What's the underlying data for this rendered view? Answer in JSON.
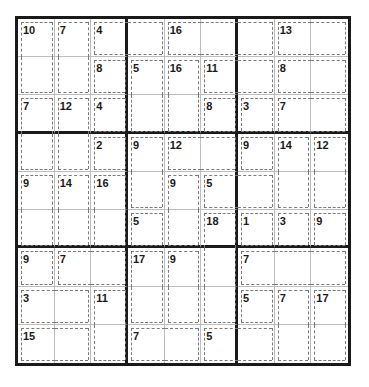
{
  "puzzle": {
    "type": "killer-sudoku",
    "size": 9,
    "cages": [
      {
        "sum": "10",
        "cells": [
          [
            0,
            0
          ],
          [
            1,
            0
          ]
        ]
      },
      {
        "sum": "7",
        "cells": [
          [
            0,
            1
          ],
          [
            1,
            1
          ]
        ]
      },
      {
        "sum": "4",
        "cells": [
          [
            0,
            2
          ],
          [
            0,
            3
          ]
        ]
      },
      {
        "sum": "16",
        "cells": [
          [
            0,
            4
          ],
          [
            0,
            5
          ],
          [
            0,
            6
          ]
        ]
      },
      {
        "sum": "13",
        "cells": [
          [
            0,
            7
          ],
          [
            0,
            8
          ]
        ]
      },
      {
        "sum": "8",
        "cells": [
          [
            1,
            2
          ]
        ]
      },
      {
        "sum": "5",
        "cells": [
          [
            1,
            3
          ],
          [
            2,
            3
          ]
        ]
      },
      {
        "sum": "16",
        "cells": [
          [
            1,
            4
          ],
          [
            2,
            4
          ]
        ]
      },
      {
        "sum": "11",
        "cells": [
          [
            1,
            5
          ],
          [
            1,
            6
          ]
        ]
      },
      {
        "sum": "8",
        "cells": [
          [
            1,
            7
          ],
          [
            1,
            8
          ]
        ]
      },
      {
        "sum": "7",
        "cells": [
          [
            2,
            0
          ],
          [
            3,
            0
          ]
        ]
      },
      {
        "sum": "12",
        "cells": [
          [
            2,
            1
          ],
          [
            3,
            1
          ]
        ]
      },
      {
        "sum": "4",
        "cells": [
          [
            2,
            2
          ]
        ]
      },
      {
        "sum": "8",
        "cells": [
          [
            2,
            5
          ]
        ]
      },
      {
        "sum": "3",
        "cells": [
          [
            2,
            6
          ]
        ]
      },
      {
        "sum": "7",
        "cells": [
          [
            2,
            7
          ],
          [
            2,
            8
          ]
        ]
      },
      {
        "sum": "2",
        "cells": [
          [
            3,
            2
          ]
        ]
      },
      {
        "sum": "9",
        "cells": [
          [
            3,
            3
          ],
          [
            4,
            3
          ]
        ]
      },
      {
        "sum": "12",
        "cells": [
          [
            3,
            4
          ],
          [
            3,
            5
          ]
        ]
      },
      {
        "sum": "9",
        "cells": [
          [
            3,
            6
          ]
        ]
      },
      {
        "sum": "14",
        "cells": [
          [
            3,
            7
          ],
          [
            4,
            7
          ]
        ]
      },
      {
        "sum": "12",
        "cells": [
          [
            3,
            8
          ],
          [
            4,
            8
          ]
        ]
      },
      {
        "sum": "9",
        "cells": [
          [
            4,
            0
          ],
          [
            5,
            0
          ]
        ]
      },
      {
        "sum": "14",
        "cells": [
          [
            4,
            1
          ],
          [
            5,
            1
          ]
        ]
      },
      {
        "sum": "16",
        "cells": [
          [
            4,
            2
          ],
          [
            5,
            2
          ]
        ]
      },
      {
        "sum": "9",
        "cells": [
          [
            4,
            4
          ],
          [
            5,
            4
          ]
        ]
      },
      {
        "sum": "5",
        "cells": [
          [
            4,
            5
          ],
          [
            4,
            6
          ]
        ]
      },
      {
        "sum": "5",
        "cells": [
          [
            5,
            3
          ]
        ]
      },
      {
        "sum": "18",
        "cells": [
          [
            5,
            5
          ],
          [
            6,
            5
          ],
          [
            7,
            5
          ]
        ]
      },
      {
        "sum": "1",
        "cells": [
          [
            5,
            6
          ]
        ]
      },
      {
        "sum": "3",
        "cells": [
          [
            5,
            7
          ]
        ]
      },
      {
        "sum": "9",
        "cells": [
          [
            5,
            8
          ]
        ]
      },
      {
        "sum": "9",
        "cells": [
          [
            6,
            0
          ]
        ]
      },
      {
        "sum": "7",
        "cells": [
          [
            6,
            1
          ],
          [
            6,
            2
          ]
        ]
      },
      {
        "sum": "17",
        "cells": [
          [
            6,
            3
          ],
          [
            7,
            3
          ]
        ]
      },
      {
        "sum": "9",
        "cells": [
          [
            6,
            4
          ],
          [
            7,
            4
          ]
        ]
      },
      {
        "sum": "7",
        "cells": [
          [
            6,
            6
          ],
          [
            6,
            7
          ],
          [
            6,
            8
          ]
        ]
      },
      {
        "sum": "3",
        "cells": [
          [
            7,
            0
          ],
          [
            7,
            1
          ]
        ]
      },
      {
        "sum": "11",
        "cells": [
          [
            7,
            2
          ],
          [
            8,
            2
          ]
        ]
      },
      {
        "sum": "5",
        "cells": [
          [
            7,
            6
          ]
        ]
      },
      {
        "sum": "7",
        "cells": [
          [
            7,
            7
          ],
          [
            8,
            7
          ]
        ]
      },
      {
        "sum": "17",
        "cells": [
          [
            7,
            8
          ],
          [
            8,
            8
          ]
        ]
      },
      {
        "sum": "15",
        "cells": [
          [
            8,
            0
          ],
          [
            8,
            1
          ]
        ]
      },
      {
        "sum": "7",
        "cells": [
          [
            8,
            3
          ],
          [
            8,
            4
          ]
        ]
      },
      {
        "sum": "5",
        "cells": [
          [
            8,
            5
          ],
          [
            8,
            6
          ]
        ]
      }
    ],
    "values": [
      [
        "",
        "",
        "",
        "",
        "",
        "",
        "",
        "",
        ""
      ],
      [
        "",
        "",
        "",
        "",
        "",
        "",
        "",
        "",
        ""
      ],
      [
        "",
        "",
        "",
        "",
        "",
        "",
        "",
        "",
        ""
      ],
      [
        "",
        "",
        "",
        "",
        "",
        "",
        "",
        "",
        ""
      ],
      [
        "",
        "",
        "",
        "",
        "",
        "",
        "",
        "",
        ""
      ],
      [
        "",
        "",
        "",
        "",
        "",
        "",
        "",
        "",
        ""
      ],
      [
        "",
        "",
        "",
        "",
        "",
        "",
        "",
        "",
        ""
      ],
      [
        "",
        "",
        "",
        "",
        "",
        "",
        "",
        "",
        ""
      ],
      [
        "",
        "",
        "",
        "",
        "",
        "",
        "",
        "",
        ""
      ]
    ]
  }
}
